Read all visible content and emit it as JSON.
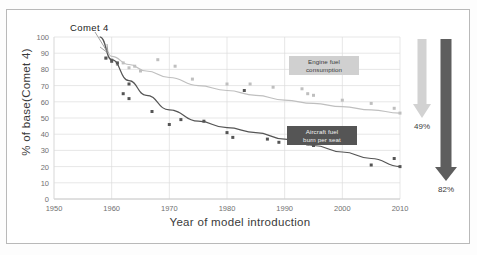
{
  "chart_data": {
    "type": "scatter",
    "title": "",
    "xlabel": "Year of model introduction",
    "ylabel": "% of base(Comet 4)",
    "xlim": [
      1950,
      2010
    ],
    "ylim": [
      0,
      100
    ],
    "xticks": [
      "1950",
      "1960",
      "1970",
      "1980",
      "1990",
      "2000",
      "2010"
    ],
    "yticks": [
      "0",
      "10",
      "20",
      "30",
      "40",
      "50",
      "60",
      "70",
      "80",
      "90",
      "100"
    ],
    "grid": true,
    "legend": "inline-labels",
    "annotations": [
      {
        "text": "Comet 4",
        "x": 1958,
        "y": 100
      },
      {
        "text": "49%",
        "note": "reduction in engine fuel consumption"
      },
      {
        "text": "82%",
        "note": "reduction in aircraft fuel burn per seat"
      }
    ],
    "series": [
      {
        "name": "Engine fuel consumption",
        "color": "#bfbfbf",
        "curve": [
          {
            "x": 1958,
            "y": 100
          },
          {
            "x": 1960,
            "y": 88
          },
          {
            "x": 1963,
            "y": 83
          },
          {
            "x": 1966,
            "y": 79
          },
          {
            "x": 1970,
            "y": 75
          },
          {
            "x": 1975,
            "y": 70
          },
          {
            "x": 1980,
            "y": 67
          },
          {
            "x": 1985,
            "y": 64
          },
          {
            "x": 1990,
            "y": 61
          },
          {
            "x": 1995,
            "y": 59
          },
          {
            "x": 2000,
            "y": 57
          },
          {
            "x": 2005,
            "y": 55
          },
          {
            "x": 2010,
            "y": 53
          }
        ],
        "points": [
          {
            "x": 1959,
            "y": 87
          },
          {
            "x": 1960,
            "y": 86
          },
          {
            "x": 1961,
            "y": 83
          },
          {
            "x": 1962,
            "y": 84
          },
          {
            "x": 1963,
            "y": 81
          },
          {
            "x": 1964,
            "y": 82
          },
          {
            "x": 1965,
            "y": 79
          },
          {
            "x": 1968,
            "y": 86
          },
          {
            "x": 1971,
            "y": 82
          },
          {
            "x": 1974,
            "y": 74
          },
          {
            "x": 1980,
            "y": 71
          },
          {
            "x": 1984,
            "y": 71
          },
          {
            "x": 1988,
            "y": 69
          },
          {
            "x": 1993,
            "y": 68
          },
          {
            "x": 1994,
            "y": 65
          },
          {
            "x": 1995,
            "y": 64
          },
          {
            "x": 2000,
            "y": 61
          },
          {
            "x": 2005,
            "y": 59
          },
          {
            "x": 2009,
            "y": 56
          },
          {
            "x": 2010,
            "y": 53
          }
        ]
      },
      {
        "name": "Aircraft fuel burn per seat",
        "color": "#555555",
        "curve": [
          {
            "x": 1958,
            "y": 100
          },
          {
            "x": 1960,
            "y": 86
          },
          {
            "x": 1963,
            "y": 73
          },
          {
            "x": 1966,
            "y": 64
          },
          {
            "x": 1970,
            "y": 55
          },
          {
            "x": 1975,
            "y": 48
          },
          {
            "x": 1980,
            "y": 44
          },
          {
            "x": 1985,
            "y": 41
          },
          {
            "x": 1990,
            "y": 37
          },
          {
            "x": 1995,
            "y": 33
          },
          {
            "x": 2000,
            "y": 29
          },
          {
            "x": 2005,
            "y": 25
          },
          {
            "x": 2010,
            "y": 20
          }
        ],
        "points": [
          {
            "x": 1959,
            "y": 87
          },
          {
            "x": 1960,
            "y": 85
          },
          {
            "x": 1961,
            "y": 84
          },
          {
            "x": 1963,
            "y": 71
          },
          {
            "x": 1962,
            "y": 65
          },
          {
            "x": 1963,
            "y": 62
          },
          {
            "x": 1967,
            "y": 54
          },
          {
            "x": 1970,
            "y": 46
          },
          {
            "x": 1972,
            "y": 49
          },
          {
            "x": 1976,
            "y": 48
          },
          {
            "x": 1980,
            "y": 41
          },
          {
            "x": 1981,
            "y": 38
          },
          {
            "x": 1983,
            "y": 67
          },
          {
            "x": 1987,
            "y": 37
          },
          {
            "x": 1989,
            "y": 35
          },
          {
            "x": 1991,
            "y": 35
          },
          {
            "x": 1994,
            "y": 34
          },
          {
            "x": 1995,
            "y": 33
          },
          {
            "x": 2005,
            "y": 21
          },
          {
            "x": 2009,
            "y": 25
          },
          {
            "x": 2010,
            "y": 20
          }
        ]
      }
    ],
    "arrows": [
      {
        "label": "49%",
        "series": "Engine fuel consumption",
        "color": "#d2d2d2"
      },
      {
        "label": "82%",
        "series": "Aircraft fuel burn per seat",
        "color": "#5e5e5e"
      }
    ]
  },
  "labels": {
    "comet": "Comet 4",
    "engine_badge": "Engine fuel\nconsumption",
    "engine_badge_l1": "Engine fuel",
    "engine_badge_l2": "consumption",
    "aircraft_badge_l1": "Aircraft fuel",
    "aircraft_badge_l2": "burn per seat",
    "pct_engine": "49%",
    "pct_aircraft": "82%"
  },
  "colors": {
    "engine": "#bfbfbf",
    "aircraft": "#555555",
    "grid": "#dcdcdc",
    "axis_text": "#707070",
    "frame": "#b9b9b9"
  }
}
